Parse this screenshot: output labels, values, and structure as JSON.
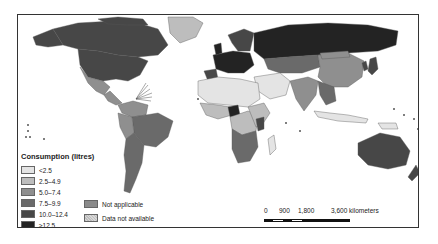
{
  "map": {
    "title": "Consumption (litres)",
    "legend": {
      "title": "Consumption (litres)",
      "classes": [
        {
          "label": "<2.5",
          "color": "#e4e4e4"
        },
        {
          "label": "2.5–4.9",
          "color": "#bdbdbd"
        },
        {
          "label": "5.0–7.4",
          "color": "#8f8f8f"
        },
        {
          "label": "7.5–9.9",
          "color": "#6a6a6a"
        },
        {
          "label": "10.0–12.4",
          "color": "#474747"
        },
        {
          "label": "≥12.5",
          "color": "#232323"
        }
      ],
      "extra": [
        {
          "label": "Not applicable",
          "color": "#8a8a8a",
          "pattern": "solid"
        },
        {
          "label": "Data not available",
          "color": "#cccccc",
          "pattern": "hatched"
        }
      ]
    },
    "scale": {
      "ticks": [
        "0",
        "900",
        "1,800",
        "3,600 kilometers"
      ],
      "unit": "kilometers"
    },
    "colors": {
      "ocean": "#ffffff",
      "border": "#333333",
      "frame": "#333333"
    }
  }
}
